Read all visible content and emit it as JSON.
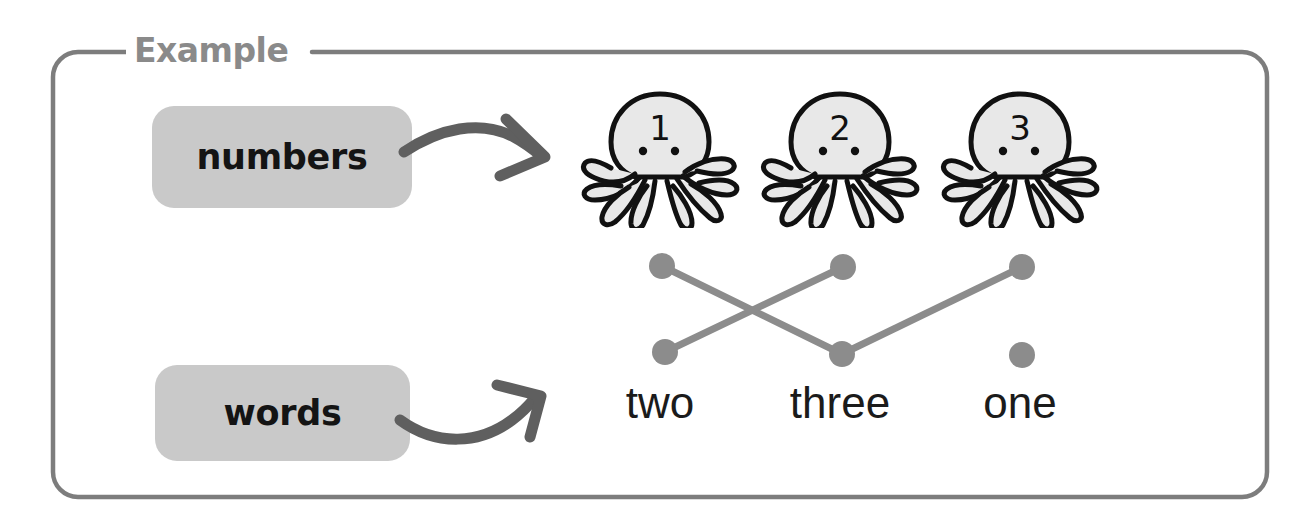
{
  "frame": {
    "legend_label": "Example",
    "border_color": "#7d7d7d",
    "background_color": "#ffffff"
  },
  "categories": [
    {
      "id": "numbers",
      "label": "numbers",
      "chip_color": "#c9c9c9",
      "text_color": "#141414"
    },
    {
      "id": "words",
      "label": "words",
      "chip_color": "#c9c9c9",
      "text_color": "#141414"
    }
  ],
  "numbers_row": {
    "icon": "octopus-icon",
    "items": [
      {
        "number": "1",
        "x": 660
      },
      {
        "number": "2",
        "x": 840
      },
      {
        "number": "3",
        "x": 1020
      }
    ]
  },
  "words_row": {
    "items": [
      {
        "word": "two",
        "x": 660
      },
      {
        "word": "three",
        "x": 840
      },
      {
        "word": "one",
        "x": 1020
      }
    ]
  },
  "matching": {
    "dot_color": "#8c8c8c",
    "line_color": "#8c8c8c",
    "top_dots": [
      {
        "id": "top-1",
        "x": 662,
        "y": 266
      },
      {
        "id": "top-2",
        "x": 843,
        "y": 267
      },
      {
        "id": "top-3",
        "x": 1022,
        "y": 267
      }
    ],
    "bottom_dots": [
      {
        "id": "bottom-two",
        "x": 665,
        "y": 352
      },
      {
        "id": "bottom-three",
        "x": 842,
        "y": 354
      },
      {
        "id": "bottom-one",
        "x": 1022,
        "y": 355
      }
    ],
    "connections": [
      {
        "from": "top-1",
        "to": "bottom-three",
        "meaning": "1 - three"
      },
      {
        "from": "top-2",
        "to": "bottom-two",
        "meaning": "2 - two"
      },
      {
        "from": "top-3",
        "to": "bottom-one",
        "meaning": "3 - one"
      }
    ]
  },
  "arrows": [
    {
      "id": "numbers-arrow",
      "color": "#5f5f5f",
      "points_to": "octopus-row"
    },
    {
      "id": "words-arrow",
      "color": "#5f5f5f",
      "points_to": "words-row"
    }
  ]
}
